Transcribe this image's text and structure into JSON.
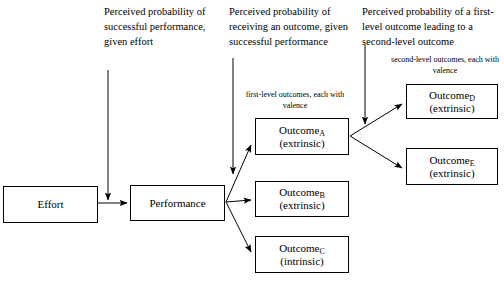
{
  "diagram": {
    "type": "flowchart",
    "nodes": [
      {
        "id": "effort",
        "label": "Effort",
        "sublabel": "",
        "subscript": ""
      },
      {
        "id": "perf",
        "label": "Performance",
        "sublabel": "",
        "subscript": ""
      },
      {
        "id": "outcome_a",
        "label": "Outcome",
        "sublabel": "(extrinsic)",
        "subscript": "A"
      },
      {
        "id": "outcome_b",
        "label": "Outcome",
        "sublabel": "(extrinsic)",
        "subscript": "B"
      },
      {
        "id": "outcome_c",
        "label": "Outcome",
        "sublabel": "(intrinsic)",
        "subscript": "C"
      },
      {
        "id": "outcome_d",
        "label": "Outcome",
        "sublabel": "(extrinsic)",
        "subscript": "D"
      },
      {
        "id": "outcome_e",
        "label": "Outcome",
        "sublabel": "(extrinsic)",
        "subscript": "E"
      }
    ],
    "annotations": {
      "expectancy": "Perceived probability of successful performance, given effort",
      "instrumentality_first": "Perceived probability of receiving an outcome, given successful performance",
      "instrumentality_second": "Perceived probability of a first-level outcome leading to a second-level outcome",
      "first_level_label": "first-level outcomes, each with valence",
      "second_level_label": "second-level outcomes, each with valence"
    },
    "colors": {
      "stroke": "#000000",
      "fill": "#ffffff",
      "text": "#000000"
    }
  }
}
